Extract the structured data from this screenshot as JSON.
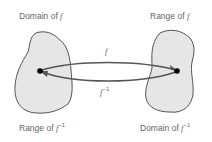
{
  "labels": {
    "domain_f": {
      "text": "Domain of ",
      "var": "f",
      "sup": ""
    },
    "range_f": {
      "text": "Range of ",
      "var": "f",
      "sup": ""
    },
    "range_finv": {
      "text": "Range of ",
      "var": "f",
      "sup": "−1"
    },
    "domain_finv": {
      "text": "Domain of ",
      "var": "f",
      "sup": "−1"
    }
  },
  "arrows": {
    "forward": {
      "var": "f",
      "sup": ""
    },
    "inverse": {
      "var": "f",
      "sup": "−1"
    }
  },
  "colors": {
    "blob_fill": "#e6e6e6",
    "blob_stroke": "#555555",
    "arrow": "#555555",
    "text": "#666666",
    "dot": "#000000"
  }
}
